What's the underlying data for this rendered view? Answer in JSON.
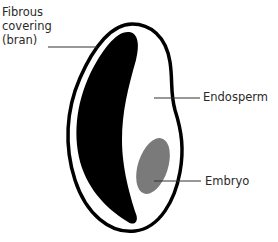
{
  "diagram": {
    "labels": {
      "bran_line1": "Fibrous",
      "bran_line2": "covering",
      "bran_line3": "(bran)",
      "endosperm": "Endosperm",
      "embryo": "Embryo"
    },
    "colors": {
      "outline": "#000000",
      "bran": "#000000",
      "endosperm": "#ffffff",
      "embryo": "#7a7a7a",
      "leader": "#333333",
      "text": "#2a2a2a"
    }
  }
}
